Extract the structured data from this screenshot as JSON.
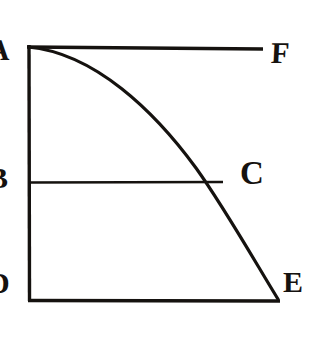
{
  "figure": {
    "background_color": "#ffffff",
    "ink_color": "#15120f",
    "stroke_width": 3.2,
    "labels": [
      {
        "id": "A",
        "text": "A",
        "role": "top-left-vertex",
        "clipped": "left"
      },
      {
        "id": "F",
        "text": "F",
        "role": "top-right-vertex",
        "clipped": "none"
      },
      {
        "id": "B",
        "text": "B",
        "role": "left-midpoint",
        "clipped": "left"
      },
      {
        "id": "C",
        "text": "C",
        "role": "curve-chord-intersection",
        "clipped": "none"
      },
      {
        "id": "D",
        "text": "D",
        "role": "bottom-left-vertex",
        "clipped": "left"
      },
      {
        "id": "E",
        "text": "E",
        "role": "bottom-right-vertex",
        "clipped": "none"
      }
    ],
    "geometry": {
      "points": {
        "A": [
          28,
          47
        ],
        "F": [
          263,
          48
        ],
        "B": [
          30,
          182
        ],
        "C": [
          222,
          182
        ],
        "D": [
          29,
          300
        ],
        "E": [
          278,
          300
        ]
      },
      "segments": [
        {
          "name": "AF-top-edge",
          "from": "A",
          "to": "F"
        },
        {
          "name": "AD-left-edge",
          "from": "A",
          "to": "D"
        },
        {
          "name": "DE-bottom-edge",
          "from": "D",
          "to": "E"
        },
        {
          "name": "BC-horizontal-chord",
          "from": "B",
          "to": "C"
        }
      ],
      "curve": {
        "name": "ACE-concave-arc",
        "from": "A",
        "to": "E",
        "through": "C",
        "shape": "quarter-ellipse",
        "path": "M 28 47 C 92 52 152 108 193 163 C 222 202 253 258 278 300"
      }
    }
  }
}
